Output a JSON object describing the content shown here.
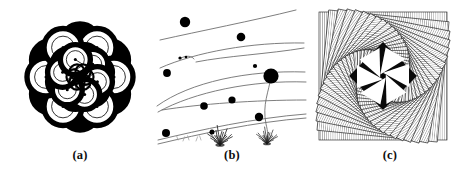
{
  "figure": {
    "background_color": "#ffffff",
    "ink_color": "#000000",
    "width": 470,
    "height": 175,
    "panel_count": 3
  },
  "panels": [
    {
      "id": "panel-a",
      "label": "(a)",
      "title": "circle rosette",
      "description": "Rotationally symmetric rosette built from overlapping thick-stroked circles; alternating black-filled and white-filled lobes, each small circle carrying a centre dot and a thin radius line.",
      "style": {
        "outer_ring_count": 12,
        "inner_ring_count": 12,
        "outer_radius": 52,
        "ring_orbit_radius": 34,
        "inner_orbit_radius": 18,
        "lobe_radius_outer": 19,
        "lobe_radius_inner": 15,
        "thick_stroke": 5.4,
        "thin_stroke": 0.8,
        "dot_radius": 1.5,
        "fill_black": "#000000",
        "fill_white": "#ffffff"
      },
      "center": {
        "x": 76,
        "y": 77
      }
    },
    {
      "id": "panel-b",
      "label": "(b)",
      "title": "curves with dots",
      "description": "Sparse scene of thin grey sweeping curves crossing the frame, scattered solid black dots of varying size, a large dot tethered by a slender stem, and two small grass tufts along the lower edge.",
      "style": {
        "curve_color": "#6f6f6f",
        "curve_width": 0.9,
        "dot_color": "#000000",
        "tuft_color": "#1a1a1a"
      },
      "curves": [
        {
          "name": "curve-top",
          "d": "M 4,40 C 44,31 96,21 140,10"
        },
        {
          "name": "curve-second-upper",
          "d": "M 4,68 C 40,52 96,42 148,43"
        },
        {
          "name": "curve-second-lower",
          "d": "M 40,62 C 70,56 112,54 148,48"
        },
        {
          "name": "curve-tail-hook",
          "d": "M 25,58 C 31,55 36,56 38,59"
        },
        {
          "name": "curve-third-upper",
          "d": "M 1,106 C 34,82 92,70 149,72"
        },
        {
          "name": "curve-third-lower",
          "d": "M 2,112 C 38,92 96,80 150,82"
        },
        {
          "name": "curve-fourth-upper",
          "d": "M 6,110 C 44,104 98,100 150,100"
        },
        {
          "name": "curve-fifth-upper",
          "d": "M 2,140 C 44,130 98,118 150,114"
        },
        {
          "name": "curve-fifth-lower",
          "d": "M 2,144 C 44,134 98,122 150,118"
        },
        {
          "name": "curve-stem",
          "d": "M 115,76 C 113,92 106,104 110,124 C 112,132 112,136 111,140"
        }
      ],
      "dots": [
        {
          "name": "dot-1",
          "cx": 29,
          "cy": 22,
          "r": 5.2
        },
        {
          "name": "dot-2",
          "cx": 85,
          "cy": 37,
          "r": 4.3
        },
        {
          "name": "dot-3",
          "cx": 24,
          "cy": 58,
          "r": 1.6
        },
        {
          "name": "dot-4",
          "cx": 30,
          "cy": 57,
          "r": 1.3
        },
        {
          "name": "dot-5",
          "cx": 11,
          "cy": 73,
          "r": 3.9
        },
        {
          "name": "dot-6",
          "cx": 99,
          "cy": 66,
          "r": 2.1
        },
        {
          "name": "dot-7-large",
          "cx": 115,
          "cy": 76,
          "r": 7.6
        },
        {
          "name": "dot-8",
          "cx": 48,
          "cy": 106,
          "r": 3.8
        },
        {
          "name": "dot-9",
          "cx": 76,
          "cy": 100,
          "r": 3.6
        },
        {
          "name": "dot-10",
          "cx": 103,
          "cy": 117,
          "r": 4.2
        },
        {
          "name": "dot-11",
          "cx": 10,
          "cy": 133,
          "r": 4.0
        },
        {
          "name": "dot-12",
          "cx": 56,
          "cy": 132,
          "r": 2.5
        }
      ],
      "tufts": [
        {
          "name": "tuft-left",
          "cx": 64,
          "cy": 143,
          "scale": 1.0
        },
        {
          "name": "tuft-right",
          "cx": 111,
          "cy": 142,
          "scale": 0.85
        }
      ]
    },
    {
      "id": "panel-c",
      "label": "(c)",
      "title": "nested rotating squares",
      "description": "Spiral of nested squares rotated in equal increments, each band filled with fine parallel hatching producing a moiré twist; the core holds a six-pointed white star pinwheel on black.",
      "style": {
        "square_count": 22,
        "rotation_step_deg": 5.6,
        "scale_step": 0.944,
        "outer_size": 128,
        "hatch_color": "#2a2a2a",
        "hatch_spacing": 2.1,
        "hatch_width": 0.55,
        "core_fill": "#0a0a0a",
        "star_fill": "#ffffff",
        "star_points": 6
      },
      "center": {
        "x": 71,
        "y": 76
      }
    }
  ]
}
